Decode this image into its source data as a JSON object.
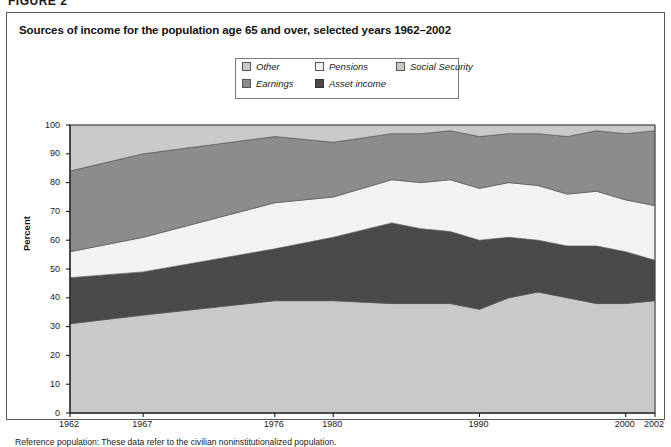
{
  "figure": {
    "label": "FIGURE 2"
  },
  "chart": {
    "title": "Sources of income for the population age 65 and over, selected years 1962–2002",
    "footnote": "Reference population: These data refer to the civilian noninstitutionalized population."
  },
  "legend": {
    "items": [
      {
        "label": "Other",
        "color": "#c9c9c9",
        "border": "#555555"
      },
      {
        "label": "Pensions",
        "color": "#f2f2f2",
        "border": "#555555"
      },
      {
        "label": "Social Security",
        "color": "#c9c9c9",
        "border": "#555555"
      },
      {
        "label": "Earnings",
        "color": "#8c8c8c",
        "border": "#555555"
      },
      {
        "label": "Asset income",
        "color": "#4a4a4a",
        "border": "#333333"
      }
    ]
  },
  "axes": {
    "y": {
      "title": "Percent",
      "min": 0,
      "max": 100,
      "ticks": [
        0,
        10,
        20,
        30,
        40,
        50,
        60,
        70,
        80,
        90,
        100
      ]
    },
    "x": {
      "min": 1962,
      "max": 2002,
      "ticks": [
        1962,
        1967,
        1976,
        1980,
        1990,
        2000,
        2002
      ],
      "tick_labels": [
        "1962",
        "1967",
        "1976",
        "1980",
        "1990",
        "2000",
        "2002"
      ]
    }
  },
  "chart_data": {
    "type": "area",
    "stacked": true,
    "title": "Sources of income for the population age 65 and over, selected years 1962–2002",
    "xlabel": "",
    "ylabel": "Percent",
    "ylim": [
      0,
      100
    ],
    "xlim": [
      1962,
      2002
    ],
    "grid": false,
    "legend_position": "top-center",
    "x": [
      1962,
      1967,
      1976,
      1980,
      1984,
      1986,
      1988,
      1990,
      1992,
      1994,
      1996,
      1998,
      2000,
      2002
    ],
    "series": [
      {
        "name": "Social Security",
        "color": "#c9c9c9",
        "values": [
          31,
          34,
          39,
          39,
          38,
          38,
          38,
          36,
          40,
          42,
          40,
          38,
          38,
          39
        ]
      },
      {
        "name": "Asset income",
        "color": "#4a4a4a",
        "values": [
          16,
          15,
          18,
          22,
          28,
          26,
          25,
          24,
          21,
          18,
          18,
          20,
          18,
          14
        ]
      },
      {
        "name": "Pensions",
        "color": "#f2f2f2",
        "values": [
          9,
          12,
          16,
          14,
          15,
          16,
          18,
          18,
          19,
          19,
          18,
          19,
          18,
          19
        ]
      },
      {
        "name": "Earnings",
        "color": "#8c8c8c",
        "values": [
          28,
          29,
          23,
          19,
          16,
          17,
          17,
          18,
          17,
          18,
          20,
          21,
          23,
          26
        ]
      },
      {
        "name": "Other",
        "color": "#c9c9c9",
        "values": [
          16,
          10,
          4,
          6,
          3,
          3,
          2,
          4,
          3,
          3,
          4,
          2,
          3,
          2
        ]
      }
    ]
  },
  "plot_geometry": {
    "left": 63,
    "right": 648,
    "top": 112,
    "bottom": 400
  }
}
